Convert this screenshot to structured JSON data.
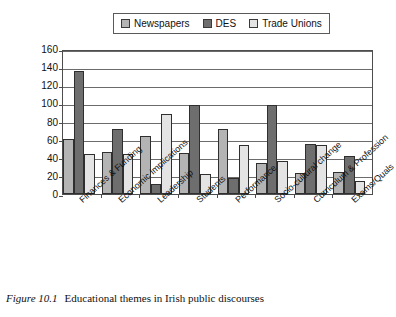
{
  "caption": {
    "figure_number": "Figure 10.1",
    "text": "Educational themes in Irish public discourses"
  },
  "legend": {
    "position": "top-center",
    "entries": [
      {
        "label": "Newspapers",
        "color": "#b4b4b4",
        "icon": "legend-swatch-icon"
      },
      {
        "label": "DES",
        "color": "#6e6e6e",
        "icon": "legend-swatch-icon"
      },
      {
        "label": "Trade Unions",
        "color": "#e4e4e4",
        "icon": "legend-swatch-icon"
      }
    ]
  },
  "chart_data": {
    "type": "bar",
    "title": "Educational themes in Irish public discourses",
    "xlabel": "",
    "ylabel": "",
    "ylim": [
      0,
      160
    ],
    "yticks": [
      0,
      20,
      40,
      60,
      80,
      100,
      120,
      140,
      160
    ],
    "ytick_labels": [
      "0",
      "20",
      "40",
      "60",
      "80",
      "100",
      "120",
      "140",
      "160"
    ],
    "grid": true,
    "legend_position": "top-center",
    "categories": [
      "Finances & Funding",
      "Economic Implications",
      "Leadership",
      "Students",
      "Performance",
      "Socio-cultural change",
      "Curriculum & Profession",
      "Exams/Quals"
    ],
    "series": [
      {
        "name": "Newspapers",
        "color": "#b4b4b4",
        "values": [
          61,
          46,
          64,
          45,
          72,
          34,
          23,
          24
        ]
      },
      {
        "name": "DES",
        "color": "#6e6e6e",
        "values": [
          136,
          72,
          11,
          98,
          18,
          98,
          55,
          42
        ]
      },
      {
        "name": "Trade Unions",
        "color": "#e4e4e4",
        "values": [
          44,
          44,
          88,
          22,
          54,
          36,
          54,
          14
        ]
      }
    ]
  }
}
